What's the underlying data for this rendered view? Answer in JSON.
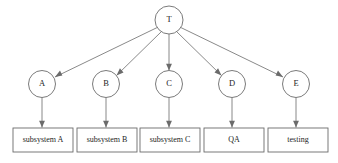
{
  "diagram": {
    "type": "tree",
    "background_color": "#ffffff",
    "line_color": "#6b6b6b",
    "text_color": "#242424",
    "root": {
      "id": "T",
      "label": "T",
      "shape": "circle",
      "cx": 169,
      "cy": 20,
      "r": 14
    },
    "level2": [
      {
        "id": "A",
        "label": "A",
        "shape": "circle",
        "cx": 42,
        "cy": 84,
        "r": 13.5
      },
      {
        "id": "B",
        "label": "B",
        "shape": "circle",
        "cx": 106,
        "cy": 84,
        "r": 13.5
      },
      {
        "id": "C",
        "label": "C",
        "shape": "circle",
        "cx": 169,
        "cy": 84,
        "r": 13.5
      },
      {
        "id": "D",
        "label": "D",
        "shape": "circle",
        "cx": 232,
        "cy": 84,
        "r": 13.5
      },
      {
        "id": "E",
        "label": "E",
        "shape": "circle",
        "cx": 296,
        "cy": 84,
        "r": 13.5
      }
    ],
    "level3": [
      {
        "id": "box-a",
        "label": "subsystem A",
        "shape": "rect",
        "x": 13,
        "y": 128,
        "w": 60,
        "h": 24
      },
      {
        "id": "box-b",
        "label": "subsystem B",
        "shape": "rect",
        "x": 77,
        "y": 128,
        "w": 60,
        "h": 24
      },
      {
        "id": "box-c",
        "label": "subsystem C",
        "shape": "rect",
        "x": 140,
        "y": 128,
        "w": 60,
        "h": 24
      },
      {
        "id": "box-d",
        "label": "QA",
        "shape": "rect",
        "x": 204,
        "y": 128,
        "w": 60,
        "h": 24
      },
      {
        "id": "box-e",
        "label": "testing",
        "shape": "rect",
        "x": 268,
        "y": 128,
        "w": 60,
        "h": 24
      }
    ],
    "edges": [
      {
        "from": "T",
        "to": "A",
        "arrow": true
      },
      {
        "from": "T",
        "to": "B",
        "arrow": true
      },
      {
        "from": "T",
        "to": "C",
        "arrow": true
      },
      {
        "from": "T",
        "to": "D",
        "arrow": true
      },
      {
        "from": "T",
        "to": "E",
        "arrow": true
      },
      {
        "from": "A",
        "to": "box-a",
        "arrow": true
      },
      {
        "from": "B",
        "to": "box-b",
        "arrow": true
      },
      {
        "from": "C",
        "to": "box-c",
        "arrow": true
      },
      {
        "from": "D",
        "to": "box-d",
        "arrow": true
      },
      {
        "from": "E",
        "to": "box-e",
        "arrow": true
      }
    ]
  }
}
